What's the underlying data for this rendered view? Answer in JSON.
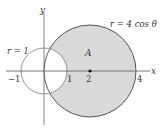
{
  "diagram": {
    "type": "polar-region",
    "curves": [
      {
        "name": "small-circle",
        "equation_label": "r = 1",
        "center": [
          0,
          0
        ],
        "radius": 1
      },
      {
        "name": "large-circle",
        "equation_label": "r = 4 cos θ",
        "center": [
          2,
          0
        ],
        "radius": 2
      }
    ],
    "region_label": "A",
    "axes": {
      "x_label": "x",
      "y_label": "y"
    },
    "ticks": [
      {
        "value": -1,
        "label": "−1"
      },
      {
        "value": 1,
        "label": "1"
      },
      {
        "value": 2,
        "label": "2"
      },
      {
        "value": 4,
        "label": "4"
      }
    ],
    "marked_point": {
      "x": 2,
      "y": 0
    },
    "colors": {
      "shade": "#d9d9d9",
      "stroke": "#555555",
      "axis": "#777777",
      "text": "#333333"
    }
  },
  "labels": {
    "big_curve": "r = 4 cos θ",
    "small_curve": "r = 1",
    "region": "A",
    "x_axis": "x",
    "y_axis": "y",
    "tick_neg1": "−1",
    "tick_1": "1",
    "tick_2": "2",
    "tick_4": "4"
  }
}
